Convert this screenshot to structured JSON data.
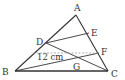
{
  "diagram": {
    "type": "triangle-geometry",
    "points": {
      "A": {
        "label": "A",
        "x": 76,
        "y": 15,
        "lx": 74,
        "ly": 11
      },
      "B": {
        "label": "B",
        "x": 15,
        "y": 71,
        "lx": 2,
        "ly": 75
      },
      "C": {
        "label": "C",
        "x": 108,
        "y": 71,
        "lx": 111,
        "ly": 77
      },
      "D": {
        "label": "D",
        "x": 46,
        "y": 43,
        "lx": 36,
        "ly": 45
      },
      "E": {
        "label": "E",
        "x": 89,
        "y": 33,
        "lx": 91,
        "ly": 36
      },
      "F": {
        "label": "F",
        "x": 99,
        "y": 53,
        "lx": 101,
        "ly": 55
      },
      "G": {
        "label": "G",
        "x": 80,
        "y": 60,
        "lx": 73,
        "ly": 70
      }
    },
    "measurement": {
      "text": "12 cm",
      "x": 37,
      "y": 60
    },
    "colors": {
      "line": "#333333",
      "dashed": "#999999"
    }
  }
}
